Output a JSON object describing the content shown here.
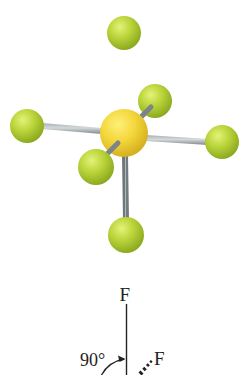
{
  "figure": {
    "molecule": "SF6",
    "geometry": "octahedral",
    "model": {
      "central_atom": {
        "element": "S",
        "color": "#f2d43a",
        "cx": 124,
        "cy": 133,
        "r": 24
      },
      "ligand_color": "#b8d43a",
      "bond_color": "#8d9598",
      "ligands": [
        {
          "id": "top",
          "element": "F",
          "cx": 124,
          "cy": 33,
          "r": 17
        },
        {
          "id": "left",
          "element": "F",
          "cx": 27,
          "cy": 126,
          "r": 17
        },
        {
          "id": "right",
          "element": "F",
          "cx": 222,
          "cy": 142,
          "r": 17
        },
        {
          "id": "bottom",
          "element": "F",
          "cx": 126,
          "cy": 235,
          "r": 18
        },
        {
          "id": "back-right",
          "element": "F",
          "cx": 155,
          "cy": 101,
          "r": 17
        },
        {
          "id": "front-left",
          "element": "F",
          "cx": 96,
          "cy": 167,
          "r": 18
        }
      ]
    },
    "structure_diagram": {
      "top_label": "F",
      "angle_label": "90°",
      "wedge_label": "F",
      "line_color": "#222222"
    }
  }
}
